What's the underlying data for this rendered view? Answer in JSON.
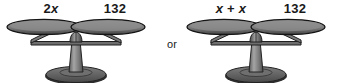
{
  "figure": {
    "background_color": "#ffffff",
    "connector_text": "or",
    "scales": [
      {
        "name": "left-balance-scale",
        "left_pan_label": "2x",
        "left_pan_label_variable": "x",
        "left_pan_label_coefficient": "2",
        "right_pan_label": "132"
      },
      {
        "name": "right-balance-scale",
        "left_pan_label": "x + x",
        "left_pan_label_term_1": "x",
        "left_pan_label_operator": "+",
        "left_pan_label_term_2": "x",
        "right_pan_label": "132"
      }
    ]
  },
  "colors": {
    "pan_fill_top": "#8a8a8a",
    "pan_fill_bottom": "#4a4a4a",
    "pan_edge": "#1c1c1c",
    "beam": "#6e6e6e",
    "beam_edge": "#1c1c1c",
    "column": "#8f8f8f",
    "base_fill": "#5f5f5f",
    "text": "#1a1a1a"
  }
}
